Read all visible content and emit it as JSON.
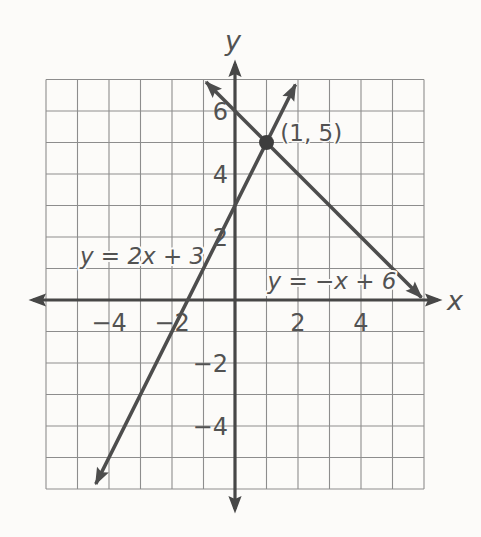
{
  "colors": {
    "paper": "#fcfbf9",
    "grid": "#8d8d8d",
    "axis": "#474747",
    "line": "#4d4d4d",
    "point": "#3d3d3d",
    "text": "#525252"
  },
  "chart_data": {
    "type": "line",
    "title": "",
    "subtitle": "",
    "xlabel": "x",
    "ylabel": "y",
    "xlim": [
      -6,
      6
    ],
    "ylim": [
      -6,
      7
    ],
    "grid": true,
    "grid_step": 1,
    "x_ticks": [
      {
        "value": -4,
        "label": "−4"
      },
      {
        "value": -2,
        "label": "−2"
      },
      {
        "value": 2,
        "label": "2"
      },
      {
        "value": 4,
        "label": "4"
      }
    ],
    "y_ticks": [
      {
        "value": 6,
        "label": "6"
      },
      {
        "value": 4,
        "label": "4"
      },
      {
        "value": 2,
        "label": "2"
      },
      {
        "value": -2,
        "label": "−2"
      },
      {
        "value": -4,
        "label": "−4"
      }
    ],
    "series": [
      {
        "name": "y = 2x + 3",
        "equation_label": "y = 2x + 3",
        "slope": 2,
        "y_intercept": 3,
        "segment": [
          [
            -4.42,
            -5.84
          ],
          [
            1.92,
            6.84
          ]
        ],
        "label_at": [
          -2.95,
          1.43
        ]
      },
      {
        "name": "y = −x + 6",
        "equation_label": "y = −x + 6",
        "slope": -1,
        "y_intercept": 6,
        "segment": [
          [
            -0.92,
            6.92
          ],
          [
            5.92,
            0.08
          ]
        ],
        "label_at": [
          3.08,
          0.62
        ]
      }
    ],
    "intersection_point": {
      "x": 1,
      "y": 5,
      "label": "(1, 5)",
      "label_at": [
        2.42,
        5.33
      ]
    }
  }
}
